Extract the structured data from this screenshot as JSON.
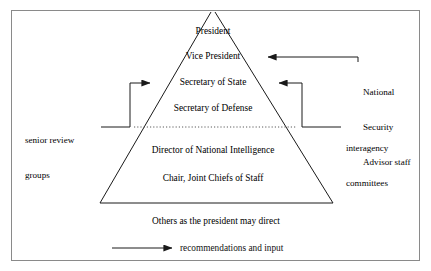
{
  "figure": {
    "title_visible": false,
    "border_color": "#8a8a8a",
    "line_color": "#1a1a1a",
    "background": "#ffffff"
  },
  "pyramid": {
    "name": "national-security-council-pyramid",
    "divider_style": "dotted",
    "tiers": [
      {
        "id": "president",
        "label": "President"
      },
      {
        "id": "vice-president",
        "label": "Vice President"
      },
      {
        "id": "secretary-of-state",
        "label": "Secretary of State"
      },
      {
        "id": "secretary-of-defense",
        "label": "Secretary of Defense"
      },
      {
        "id": "director-of-national-intelligence",
        "label": "Director of National Intelligence"
      },
      {
        "id": "chair-joint-chiefs-of-staff",
        "label": "Chair, Joint Chiefs of Staff"
      }
    ]
  },
  "annotations": {
    "left": {
      "id": "senior-review-groups",
      "line1": "senior review",
      "line2": "groups"
    },
    "right_top": {
      "id": "national-security-advisor-staff",
      "line1": "National",
      "line2": "Security",
      "line3": "Advisor staff"
    },
    "right_bottom": {
      "id": "interagency-committees",
      "line1": "interagency",
      "line2": "committees"
    }
  },
  "footer": {
    "others_note": "Others as the president may direct"
  },
  "legend": {
    "arrow_icon": "arrow-right-icon",
    "label": "recommendations and input"
  }
}
